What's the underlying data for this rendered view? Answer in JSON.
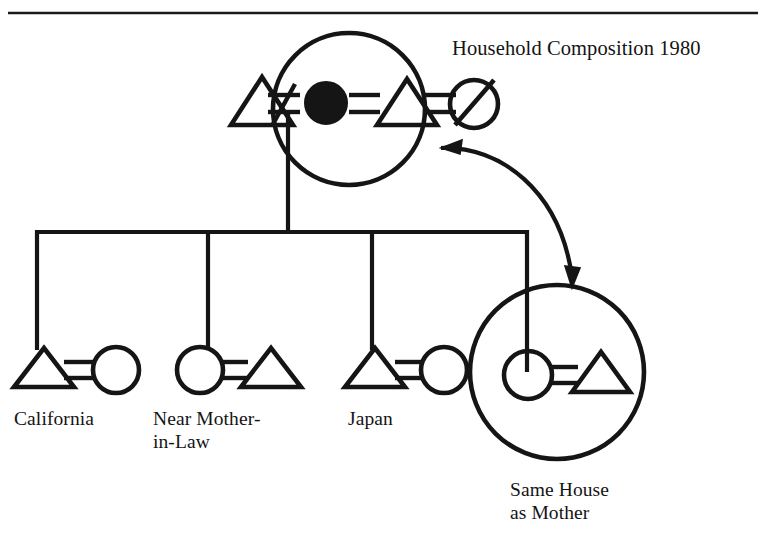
{
  "page": {
    "domain": "kinship-diagram",
    "width": 766,
    "height": 548,
    "background_color": "#ffffff",
    "ink_color": "#151515"
  },
  "header": {
    "rule_visible": true,
    "clipped_running_head": "ng Japan"
  },
  "title": {
    "text": "Household Composition 1980"
  },
  "legend_symbols": {
    "triangle": "male",
    "circle": "female",
    "filled_circle": "ego-female-focal",
    "slashed_circle": "deceased-female",
    "equals": "marriage",
    "not_equals": "divorce-or-separation",
    "enclosing_ellipse": "co-residential-household",
    "double_arrow": "same-household-link"
  },
  "top_household": {
    "name": "Household Composition 1980",
    "enclosure_shape": "ellipse",
    "members": [
      {
        "id": "m1",
        "symbol": "triangle",
        "sex": "male",
        "status": "living",
        "inside_household": false
      },
      {
        "id": "f_ego",
        "symbol": "filled-circle",
        "sex": "female",
        "status": "living",
        "inside_household": true
      },
      {
        "id": "m2",
        "symbol": "triangle",
        "sex": "male",
        "status": "living",
        "inside_household": true
      },
      {
        "id": "f_dec",
        "symbol": "slashed-circle",
        "sex": "female",
        "status": "deceased",
        "inside_household": false
      }
    ],
    "unions": [
      {
        "from": "m1",
        "to": "f_ego",
        "type": "divorce",
        "glyph": "not-equals"
      },
      {
        "from": "f_ego",
        "to": "m2",
        "type": "marriage",
        "glyph": "equals"
      },
      {
        "from": "m2",
        "to": "f_dec",
        "type": "divorce",
        "glyph": "not-equals"
      }
    ]
  },
  "children": [
    {
      "index": 1,
      "label": "California",
      "label_lines": [
        "California"
      ],
      "couple": [
        {
          "symbol": "triangle",
          "sex": "male"
        },
        {
          "symbol": "circle",
          "sex": "female"
        }
      ],
      "union_glyph": "equals",
      "enclosed_in_household": false
    },
    {
      "index": 2,
      "label": "Near Mother-in-Law",
      "label_lines": [
        "Near Mother-",
        "in-Law"
      ],
      "couple": [
        {
          "symbol": "circle",
          "sex": "female"
        },
        {
          "symbol": "triangle",
          "sex": "male"
        }
      ],
      "union_glyph": "equals",
      "enclosed_in_household": false
    },
    {
      "index": 3,
      "label": "Japan",
      "label_lines": [
        "Japan"
      ],
      "couple": [
        {
          "symbol": "triangle",
          "sex": "male"
        },
        {
          "symbol": "circle",
          "sex": "female"
        }
      ],
      "union_glyph": "equals",
      "enclosed_in_household": false
    },
    {
      "index": 4,
      "label": "Same House as Mother",
      "label_lines": [
        "Same House",
        "as Mother"
      ],
      "couple": [
        {
          "symbol": "circle",
          "sex": "female"
        },
        {
          "symbol": "triangle",
          "sex": "male"
        }
      ],
      "union_glyph": "equals",
      "enclosed_in_household": true,
      "enclosure_shape": "circle"
    }
  ],
  "annotation_arrow": {
    "type": "double-headed-curve",
    "from": "child-4-household-circle",
    "to": "top-household-ellipse",
    "meaning": "same-house-as-mother"
  }
}
